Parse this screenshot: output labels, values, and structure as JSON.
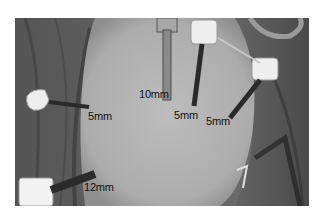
{
  "figure": {
    "colors": {
      "drape": "#5f5f5f",
      "skin": "#b4b4b4",
      "label_text": "#111111",
      "port_cap": "#eeeeee",
      "cannula": "#2a2a2a"
    },
    "labels": [
      {
        "id": "port-10mm",
        "text": "10mm"
      },
      {
        "id": "port-5mm-center",
        "text": "5mm"
      },
      {
        "id": "port-5mm-right",
        "text": "5mm"
      },
      {
        "id": "port-5mm-left",
        "text": "5mm"
      },
      {
        "id": "port-12mm",
        "text": "12mm"
      }
    ]
  }
}
